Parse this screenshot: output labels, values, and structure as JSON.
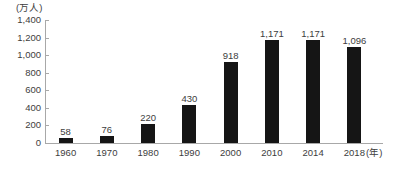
{
  "chart_data": {
    "type": "bar",
    "title": "",
    "xlabel": "(年)",
    "ylabel": "(万人)",
    "categories": [
      "1960",
      "1970",
      "1980",
      "1990",
      "2000",
      "2010",
      "2014",
      "2018"
    ],
    "values": [
      58,
      76,
      220,
      430,
      918,
      1171,
      1171,
      1096
    ],
    "value_labels": [
      "58",
      "76",
      "220",
      "430",
      "918",
      "1,171",
      "1,171",
      "1,096"
    ],
    "ylim": [
      0,
      1400
    ],
    "yticks": [
      0,
      200,
      400,
      600,
      800,
      1000,
      1200,
      1400
    ],
    "ytick_labels": [
      "0",
      "200",
      "400",
      "600",
      "800",
      "1,000",
      "1,200",
      "1,400"
    ],
    "grid": false,
    "legend": "none",
    "bar_color": "#151515",
    "axis_color": "#a8a8a8",
    "text_color": "#3d3d3d"
  }
}
